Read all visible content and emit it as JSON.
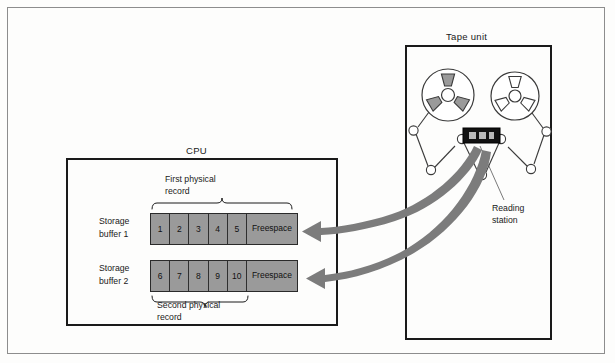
{
  "figure": {
    "title": ""
  },
  "cpu": {
    "title": "CPU",
    "buffers": [
      {
        "label_line1": "Storage",
        "label_line2": "buffer 1",
        "cells": [
          "1",
          "2",
          "3",
          "4",
          "5"
        ],
        "free_line1": "Free",
        "free_line2": "space",
        "bracket_label_line1": "First physical",
        "bracket_label_line2": "record"
      },
      {
        "label_line1": "Storage",
        "label_line2": "buffer 2",
        "cells": [
          "6",
          "7",
          "8",
          "9",
          "10"
        ],
        "free_line1": "Free",
        "free_line2": "space",
        "bracket_label_line1": "Second physical",
        "bracket_label_line2": "record"
      }
    ]
  },
  "tape_unit": {
    "title": "Tape unit",
    "reading_station_line1": "Reading",
    "reading_station_line2": "station",
    "left_reel": {
      "spokes_filled": true,
      "spoke_count": 3
    },
    "right_reel": {
      "spokes_filled": false,
      "spoke_count": 3
    }
  },
  "colors": {
    "buffer_fill": "#9a9a9a",
    "arrow_fill": "#7c7c7c",
    "box_stroke": "#1a1a1a",
    "outer_frame": "#8d8d8d",
    "reel_spoke_filled": "#9a9a9a",
    "reel_spoke_empty": "#ffffff",
    "read_head": "#111111"
  }
}
